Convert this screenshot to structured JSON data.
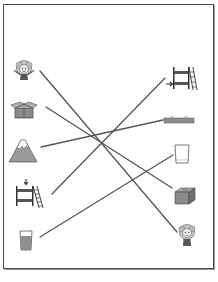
{
  "worksheet": {
    "type": "matching-exercise",
    "frame_color": "#4a4a4a",
    "line_color": "#555555",
    "left_column": [
      {
        "id": "girl-cheerful",
        "label": "cheerful girl",
        "x": 24,
        "y": 72
      },
      {
        "id": "box-open",
        "label": "open box",
        "x": 24,
        "y": 111
      },
      {
        "id": "mountain",
        "label": "mountain",
        "x": 23,
        "y": 152
      },
      {
        "id": "bunk-bed-down",
        "label": "bunk bed with down arrow",
        "x": 28,
        "y": 195
      },
      {
        "id": "glass-full",
        "label": "full glass",
        "x": 26,
        "y": 240
      }
    ],
    "right_column": [
      {
        "id": "bunk-bed-side",
        "label": "bunk bed with side arrow",
        "x": 183,
        "y": 80
      },
      {
        "id": "flat-land",
        "label": "flat land",
        "x": 192,
        "y": 120
      },
      {
        "id": "glass-empty",
        "label": "empty glass",
        "x": 182,
        "y": 154
      },
      {
        "id": "box-closed",
        "label": "closed box",
        "x": 185,
        "y": 196
      },
      {
        "id": "girl-sad",
        "label": "sad girl",
        "x": 187,
        "y": 236
      }
    ],
    "connections": [
      {
        "from": "girl-cheerful",
        "to": "girl-sad",
        "x1": 40,
        "y1": 71,
        "x2": 177,
        "y2": 232
      },
      {
        "from": "box-open",
        "to": "box-closed",
        "x1": 46,
        "y1": 107,
        "x2": 172,
        "y2": 188
      },
      {
        "from": "mountain",
        "to": "flat-land",
        "x1": 41,
        "y1": 147,
        "x2": 163,
        "y2": 120
      },
      {
        "from": "bunk-bed-down",
        "to": "bunk-bed-side",
        "x1": 52,
        "y1": 194,
        "x2": 165,
        "y2": 78
      },
      {
        "from": "glass-full",
        "to": "glass-empty",
        "x1": 40,
        "y1": 237,
        "x2": 173,
        "y2": 155
      }
    ]
  }
}
